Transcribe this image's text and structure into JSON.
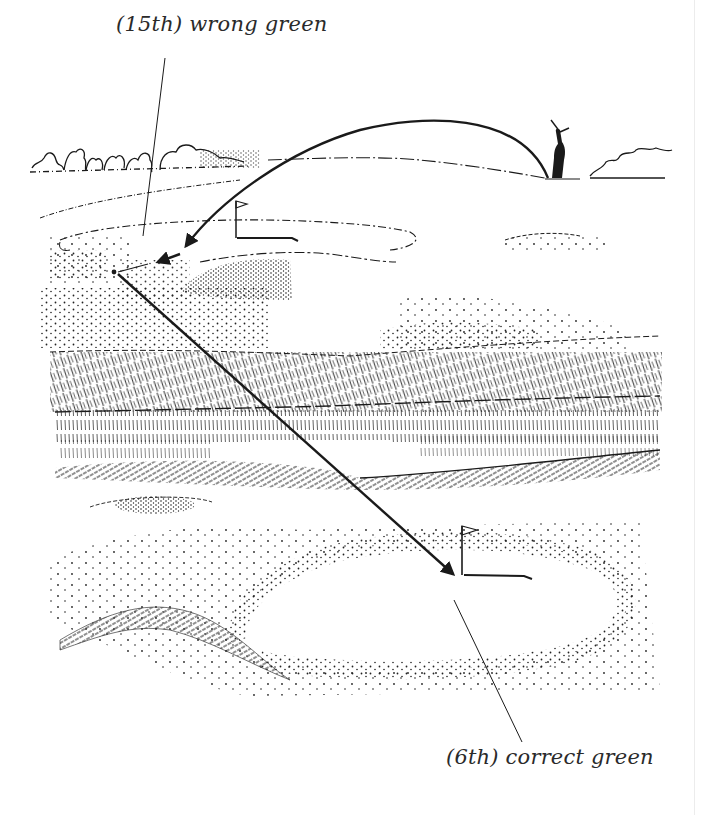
{
  "illustration": {
    "subject": "Golf course sketch: shot landing on wrong green, then played to correct green",
    "labels": {
      "wrong_green": "(15th) wrong green",
      "correct_green": "(6th) correct green"
    },
    "elements": {
      "golfer": "golfer-silhouette",
      "flag_wrong": "flag-icon",
      "flag_correct": "flag-icon",
      "shot_arc": "curved-arrow",
      "second_shot": "straight-arrow"
    },
    "colors": {
      "ink": "#1a1a1a",
      "paper": "#ffffff",
      "label_text": "#2a2a2a"
    }
  }
}
